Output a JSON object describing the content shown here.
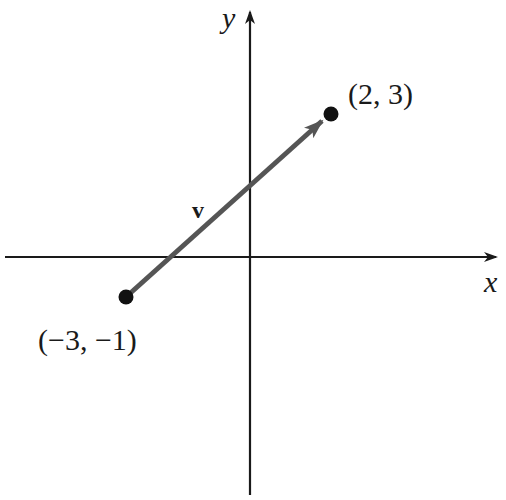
{
  "diagram": {
    "type": "vector-on-coordinate-plane",
    "axes": {
      "x_label": "x",
      "y_label": "y"
    },
    "vector": {
      "label": "v",
      "color": "#555555",
      "initial_point": {
        "x": -3,
        "y": -1,
        "label": "(−3, −1)"
      },
      "terminal_point": {
        "x": 2,
        "y": 3,
        "label": "(2, 3)"
      }
    },
    "colors": {
      "axis": "#1a1a1a",
      "point": "#111111",
      "vector": "#555555"
    }
  }
}
